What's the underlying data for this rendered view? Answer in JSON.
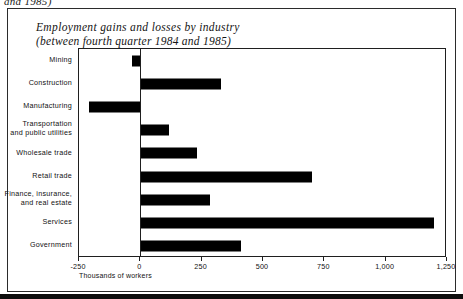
{
  "page": {
    "cutoff_text": "and 1985)"
  },
  "figure": {
    "title_line1": "Employment gains and losses by industry",
    "title_line2": "(between fourth quarter 1984 and 1985)",
    "axis_caption": "Thousands of workers"
  },
  "chart_data": {
    "type": "bar",
    "orientation": "horizontal",
    "title": "Employment gains and losses by industry (between fourth quarter 1984 and 1985)",
    "xlabel": "Thousands of workers",
    "ylabel": "",
    "xlim": [
      -250,
      1250
    ],
    "grid": false,
    "legend": "none",
    "bar_color": "#000000",
    "xticks": [
      -250,
      0,
      250,
      500,
      750,
      1000,
      1250
    ],
    "xtick_labels": [
      "-250",
      "0",
      "250",
      "500",
      "750",
      "1,000",
      "1,250"
    ],
    "categories": [
      "Mining",
      "Construction",
      "Manufacturing",
      "Transportation and public utilities",
      "Wholesale trade",
      "Retail trade",
      "Finance, insurance, and real estate",
      "Services",
      "Government"
    ],
    "category_labels": [
      {
        "line1": "Mining",
        "line2": ""
      },
      {
        "line1": "Construction",
        "line2": ""
      },
      {
        "line1": "Manufacturing",
        "line2": ""
      },
      {
        "line1": "Transportation",
        "line2": "and public utilities"
      },
      {
        "line1": "Wholesale trade",
        "line2": ""
      },
      {
        "line1": "Retail trade",
        "line2": ""
      },
      {
        "line1": "Finance, insurance,",
        "line2": "and real estate"
      },
      {
        "line1": "Services",
        "line2": ""
      },
      {
        "line1": "Government",
        "line2": ""
      }
    ],
    "values": [
      -35,
      330,
      -210,
      115,
      230,
      700,
      285,
      1195,
      410
    ]
  }
}
